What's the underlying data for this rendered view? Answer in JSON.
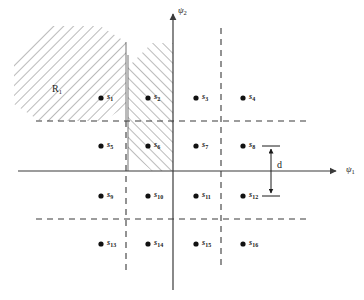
{
  "figure": {
    "type": "signal-constellation-diagram",
    "background_color": "#ffffff",
    "line_color": "#3a3a3a",
    "hatch_color": "#555555"
  },
  "axes": {
    "x": {
      "name": "psi-1",
      "label": "ψ",
      "subscript": "1",
      "start_px": [
        18,
        171
      ],
      "end_px": [
        340,
        171
      ],
      "arrow": "right"
    },
    "y": {
      "name": "psi-2",
      "label": "ψ",
      "subscript": "2",
      "start_px": [
        173,
        290
      ],
      "end_px": [
        173,
        10
      ],
      "arrow": "up"
    }
  },
  "grid": {
    "style": "dashed",
    "vertical_lines_px": [
      126,
      221
    ],
    "horizontal_lines_px": [
      121,
      219
    ],
    "horizontal_extent_px": [
      36,
      311
    ],
    "vertical_extent_px": [
      28,
      270
    ]
  },
  "regions": [
    {
      "id": "R1",
      "label": "R",
      "subscript": "1",
      "hatch_direction": "down-right",
      "description": "upper-left decision region"
    },
    {
      "id": "R2",
      "label": "",
      "subscript": "",
      "hatch_direction": "up-right",
      "description": "second-quadrant strip adjacent to psi-2 axis"
    }
  ],
  "points": [
    {
      "id": "s1",
      "label": "s",
      "subscript": "1",
      "x": 101,
      "y": 98
    },
    {
      "id": "s2",
      "label": "s",
      "subscript": "2",
      "x": 148,
      "y": 98
    },
    {
      "id": "s3",
      "label": "s",
      "subscript": "3",
      "x": 196,
      "y": 98
    },
    {
      "id": "s4",
      "label": "s",
      "subscript": "4",
      "x": 243,
      "y": 98
    },
    {
      "id": "s5",
      "label": "s",
      "subscript": "5",
      "x": 101,
      "y": 146
    },
    {
      "id": "s6",
      "label": "s",
      "subscript": "6",
      "x": 148,
      "y": 146
    },
    {
      "id": "s7",
      "label": "s",
      "subscript": "7",
      "x": 196,
      "y": 146
    },
    {
      "id": "s8",
      "label": "s",
      "subscript": "8",
      "x": 243,
      "y": 146
    },
    {
      "id": "s9",
      "label": "s",
      "subscript": "9",
      "x": 101,
      "y": 196
    },
    {
      "id": "s10",
      "label": "s",
      "subscript": "10",
      "x": 148,
      "y": 196
    },
    {
      "id": "s11",
      "label": "s",
      "subscript": "11",
      "x": 196,
      "y": 196
    },
    {
      "id": "s12",
      "label": "s",
      "subscript": "12",
      "x": 243,
      "y": 196
    },
    {
      "id": "s13",
      "label": "s",
      "subscript": "13",
      "x": 101,
      "y": 244
    },
    {
      "id": "s14",
      "label": "s",
      "subscript": "14",
      "x": 148,
      "y": 244
    },
    {
      "id": "s15",
      "label": "s",
      "subscript": "15",
      "x": 196,
      "y": 244
    },
    {
      "id": "s16",
      "label": "s",
      "subscript": "16",
      "x": 243,
      "y": 244
    }
  ],
  "dimension": {
    "id": "d",
    "label": "d",
    "x_px": 271,
    "y_top_px": 146,
    "y_bottom_px": 196,
    "description": "vertical spacing between adjacent constellation points"
  }
}
